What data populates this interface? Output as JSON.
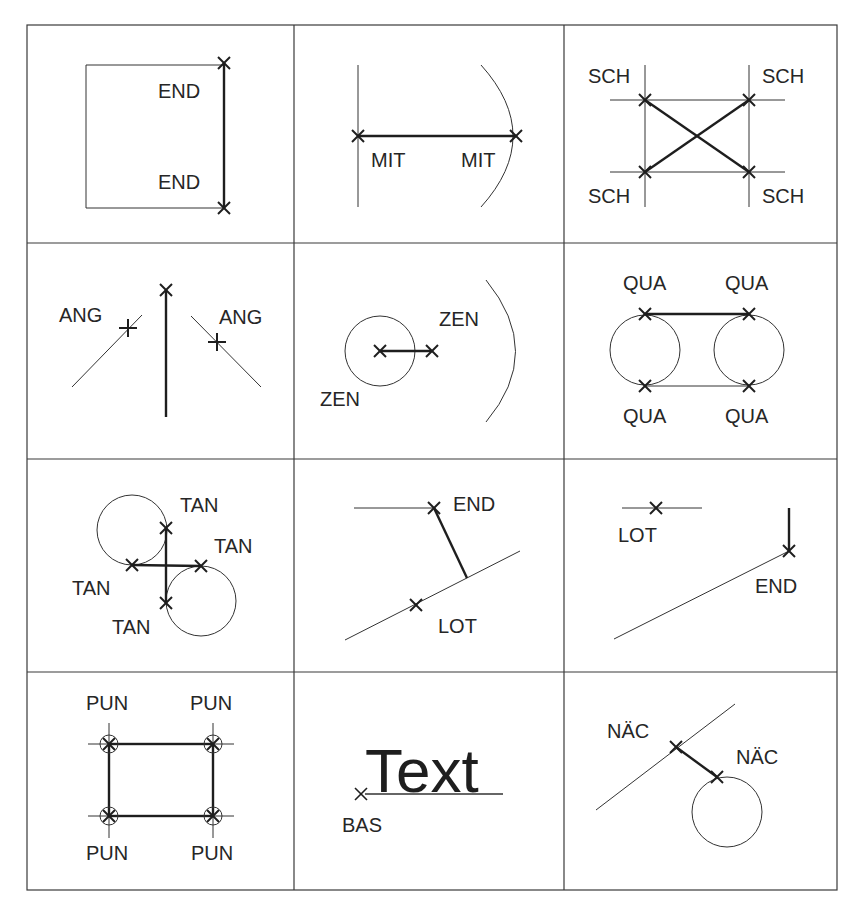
{
  "figure": {
    "colors": {
      "line": "#1e1e1e",
      "thin_line": "#333333",
      "grid": "#3a3a3a",
      "text": "#262626",
      "background": "#ffffff"
    },
    "grid": {
      "left": 27,
      "top": 25,
      "right": 837,
      "bottom": 890,
      "columns_x": [
        294,
        564
      ],
      "rows_y": [
        243,
        459,
        672
      ]
    }
  },
  "cells": [
    {
      "id": "endpoint",
      "row": 1,
      "col": 1,
      "snap": "END",
      "labels": [
        "END",
        "END"
      ]
    },
    {
      "id": "midpoint",
      "row": 1,
      "col": 2,
      "snap": "MIT",
      "labels": [
        "MIT",
        "MIT"
      ]
    },
    {
      "id": "intersection",
      "row": 1,
      "col": 3,
      "snap": "SCH",
      "labels": [
        "SCH",
        "SCH",
        "SCH",
        "SCH"
      ]
    },
    {
      "id": "angle",
      "row": 2,
      "col": 1,
      "snap": "ANG",
      "labels": [
        "ANG",
        "ANG"
      ]
    },
    {
      "id": "center",
      "row": 2,
      "col": 2,
      "snap": "ZEN",
      "labels": [
        "ZEN",
        "ZEN"
      ]
    },
    {
      "id": "quadrant",
      "row": 2,
      "col": 3,
      "snap": "QUA",
      "labels": [
        "QUA",
        "QUA",
        "QUA",
        "QUA"
      ]
    },
    {
      "id": "tangent",
      "row": 3,
      "col": 1,
      "snap": "TAN",
      "labels": [
        "TAN",
        "TAN",
        "TAN",
        "TAN"
      ]
    },
    {
      "id": "perpendicular-a",
      "row": 3,
      "col": 2,
      "snap": "LOT",
      "labels": [
        "END",
        "LOT"
      ]
    },
    {
      "id": "perpendicular-b",
      "row": 3,
      "col": 3,
      "snap": "LOT",
      "labels": [
        "LOT",
        "END"
      ]
    },
    {
      "id": "node",
      "row": 4,
      "col": 1,
      "snap": "PUN",
      "labels": [
        "PUN",
        "PUN",
        "PUN",
        "PUN"
      ]
    },
    {
      "id": "insertion",
      "row": 4,
      "col": 2,
      "snap": "BAS",
      "labels": [
        "BAS"
      ],
      "sample_text": "Text"
    },
    {
      "id": "nearest",
      "row": 4,
      "col": 3,
      "snap": "NÄC",
      "labels": [
        "NÄC",
        "NÄC"
      ]
    }
  ]
}
